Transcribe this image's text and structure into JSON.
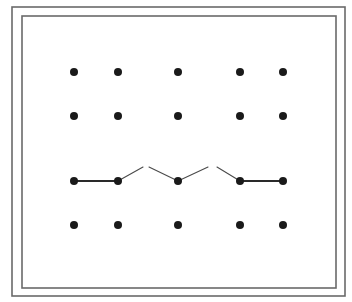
{
  "diagram": {
    "colors": {
      "background": "#ffffff",
      "frame": "#6a6a6a",
      "dot": "#1a1a1a",
      "thick_line": "#2a2a2a",
      "thin_line": "#4a4a4a"
    },
    "frame": {
      "outer": {
        "x": 12,
        "y": 7,
        "w": 333,
        "h": 289
      },
      "inner": {
        "x": 22,
        "y": 16,
        "w": 314,
        "h": 272
      }
    },
    "dot_radius": 4,
    "columns_x": [
      74,
      118,
      178,
      240,
      283
    ],
    "rows_y": [
      72,
      116,
      181,
      225
    ],
    "segments": [
      {
        "x1": 74,
        "y1": 181,
        "x2": 118,
        "y2": 181,
        "weight": "thick"
      },
      {
        "x1": 118,
        "y1": 181,
        "x2": 143,
        "y2": 167,
        "weight": "thin"
      },
      {
        "x1": 149,
        "y1": 167,
        "x2": 178,
        "y2": 181,
        "weight": "thin"
      },
      {
        "x1": 178,
        "y1": 181,
        "x2": 208,
        "y2": 167,
        "weight": "thin"
      },
      {
        "x1": 217,
        "y1": 167,
        "x2": 240,
        "y2": 181,
        "weight": "thin"
      },
      {
        "x1": 240,
        "y1": 181,
        "x2": 283,
        "y2": 181,
        "weight": "thick"
      }
    ]
  }
}
